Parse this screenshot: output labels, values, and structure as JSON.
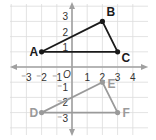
{
  "diagram": {
    "type": "coordinate-plane",
    "origin_label": "O",
    "x_tick_labels": [
      {
        "value": -3,
        "label": "⁻3"
      },
      {
        "value": -2,
        "label": "⁻2"
      },
      {
        "value": -1,
        "label": "⁻1"
      },
      {
        "value": 1,
        "label": "1"
      },
      {
        "value": 2,
        "label": "2"
      },
      {
        "value": 3,
        "label": "3"
      },
      {
        "value": 4,
        "label": "4"
      }
    ],
    "y_tick_labels": [
      {
        "value": 3,
        "label": "3"
      },
      {
        "value": 2,
        "label": "2"
      },
      {
        "value": 1,
        "label": "1"
      },
      {
        "value": -1,
        "label": "⁻1"
      },
      {
        "value": -2,
        "label": "⁻2"
      },
      {
        "value": -3,
        "label": "⁻3"
      }
    ],
    "triangles": [
      {
        "name": "ABC",
        "color": "#1a1a1a",
        "vertices": [
          {
            "label": "A",
            "x": -2,
            "y": 1
          },
          {
            "label": "B",
            "x": 2,
            "y": 3
          },
          {
            "label": "C",
            "x": 3,
            "y": 1
          }
        ]
      },
      {
        "name": "DEF",
        "color": "#9a9a9a",
        "vertices": [
          {
            "label": "D",
            "x": -2,
            "y": -3
          },
          {
            "label": "E",
            "x": 2,
            "y": -1
          },
          {
            "label": "F",
            "x": 3,
            "y": -3
          }
        ]
      }
    ],
    "colors": {
      "grid": "#dcdcdc",
      "axis": "#a0a0a0",
      "tick_text": "#333333"
    }
  }
}
